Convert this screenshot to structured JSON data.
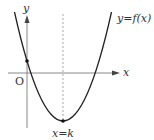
{
  "diagram": {
    "type": "function-graph",
    "labels": {
      "y_axis": "y",
      "x_axis": "x",
      "origin": "O",
      "curve": "y=f(x)",
      "symmetry_line": "x=k"
    },
    "colors": {
      "curve": "#222222",
      "axes": "#888888",
      "dashed_line": "#aaaaaa",
      "text": "#333333",
      "background": "#ffffff"
    },
    "features": {
      "vertex_marked": true,
      "y_intercept_marked": true,
      "y_intercept_sign": "positive",
      "vertex_position": "below x-axis, right of y-axis",
      "x_intercepts": 2
    }
  }
}
